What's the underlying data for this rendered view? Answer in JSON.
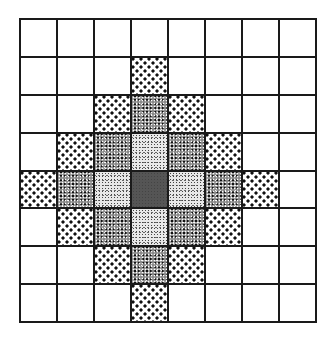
{
  "figure": {
    "type": "grid-diagram",
    "rows": 8,
    "cols": 8,
    "center": {
      "row": 4,
      "col": 3
    },
    "legend_by_distance": {
      "0": "dark",
      "1": "light",
      "2": "dense",
      "3": "dots"
    },
    "default_fill": "blank",
    "fills": [
      [
        "blank",
        "blank",
        "blank",
        "blank",
        "blank",
        "blank",
        "blank",
        "blank"
      ],
      [
        "blank",
        "blank",
        "blank",
        "dots",
        "blank",
        "blank",
        "blank",
        "blank"
      ],
      [
        "blank",
        "blank",
        "dots",
        "dense",
        "dots",
        "blank",
        "blank",
        "blank"
      ],
      [
        "blank",
        "dots",
        "dense",
        "light",
        "dense",
        "dots",
        "blank",
        "blank"
      ],
      [
        "dots",
        "dense",
        "light",
        "dark",
        "light",
        "dense",
        "dots",
        "blank"
      ],
      [
        "blank",
        "dots",
        "dense",
        "light",
        "dense",
        "dots",
        "blank",
        "blank"
      ],
      [
        "blank",
        "blank",
        "dots",
        "dense",
        "dots",
        "blank",
        "blank",
        "blank"
      ],
      [
        "blank",
        "blank",
        "blank",
        "dots",
        "blank",
        "blank",
        "blank",
        "blank"
      ]
    ],
    "colors": {
      "grid_line": "#1a1a1a",
      "background": "#ffffff",
      "center_fill": "#555555"
    }
  }
}
